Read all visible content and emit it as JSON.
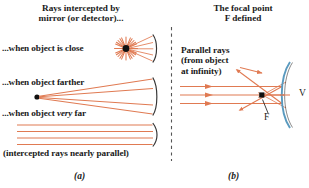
{
  "figure": {
    "panel_a": {
      "heading_line1": "Rays intercepted by",
      "heading_line2": "mirror (or detector)...",
      "case_close": "...when object is close",
      "case_farther": "...when object farther",
      "case_veryfar_pre": "...when object ",
      "case_veryfar_em": "very",
      "case_veryfar_post": " far",
      "note": "(intercepted rays nearly parallel)",
      "label": "(a)"
    },
    "panel_b": {
      "heading_line1": "The focal point",
      "heading_line2": "F defined",
      "annot_line1": "Parallel rays",
      "annot_line2": "(from object",
      "annot_line3": "at infinity)",
      "focal_label": "F",
      "vertex_label": "V",
      "label": "(b)"
    },
    "colors": {
      "ray": "#E07A52",
      "ray_light": "#F0A885",
      "mirror": "#6FA8C8",
      "text": "#1a1a1a",
      "divider": "#555555",
      "source_dot": "#111111"
    }
  }
}
